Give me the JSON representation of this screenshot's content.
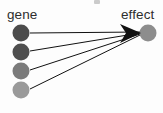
{
  "figure": {
    "type": "node-link-diagram",
    "width": 163,
    "height": 113,
    "background_color": "#fdfdfd",
    "source_label": "gene",
    "target_label": "effect",
    "label_color": "#2e2e2e",
    "edge_color": "#111111",
    "arrowhead_color": "#111111"
  },
  "chart_data": {
    "type": "diagram",
    "title": "",
    "xlabel": "",
    "ylabel": "",
    "nodes": [
      {
        "id": "gene-1",
        "group": "gene",
        "label": "",
        "cx": 21,
        "cy": 33,
        "r": 8.5,
        "color": "#4c4c4c"
      },
      {
        "id": "gene-2",
        "group": "gene",
        "label": "",
        "cx": 21,
        "cy": 52,
        "r": 8.5,
        "color": "#4f4f4f"
      },
      {
        "id": "gene-3",
        "group": "gene",
        "label": "",
        "cx": 21,
        "cy": 71,
        "r": 8.5,
        "color": "#7b7b7b"
      },
      {
        "id": "gene-4",
        "group": "gene",
        "label": "",
        "cx": 21,
        "cy": 90,
        "r": 8.5,
        "color": "#9a9a9a"
      },
      {
        "id": "effect-1",
        "group": "effect",
        "label": "",
        "cx": 148,
        "cy": 33,
        "r": 8.5,
        "color": "#8d8d8d"
      }
    ],
    "edges": [
      {
        "from": "gene-1",
        "to": "effect-1",
        "x1": 30,
        "y1": 33,
        "x2": 140,
        "y2": 32
      },
      {
        "from": "gene-2",
        "to": "effect-1",
        "x1": 30,
        "y1": 51,
        "x2": 140,
        "y2": 33
      },
      {
        "from": "gene-3",
        "to": "effect-1",
        "x1": 30,
        "y1": 70,
        "x2": 140,
        "y2": 34
      },
      {
        "from": "gene-4",
        "to": "effect-1",
        "x1": 30,
        "y1": 89,
        "x2": 140,
        "y2": 35
      }
    ],
    "arrowhead": {
      "tip_x": 141,
      "tip_y": 33,
      "points": "141,33 120,24 126,33 120,43"
    },
    "legend_position": "none",
    "grid": false
  },
  "labels": {
    "gene": "gene",
    "effect": "effect"
  }
}
